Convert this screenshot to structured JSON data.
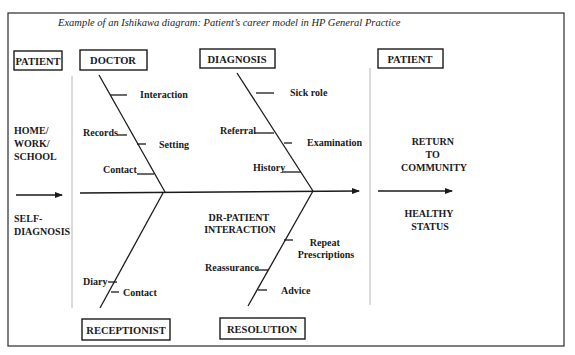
{
  "title": "Example of an Ishikawa diagram: Patient’s career  model in HP General Practice",
  "left_column": {
    "header": "PATIENT",
    "top_text": [
      "HOME/",
      "WORK/",
      "SCHOOL"
    ],
    "bottom_text": [
      "SELF-",
      "DIAGNOSIS"
    ]
  },
  "right_column": {
    "header": "PATIENT",
    "top_text": [
      "RETURN",
      "TO",
      "COMMUNITY"
    ],
    "bottom_text": [
      "HEALTHY",
      "STATUS"
    ]
  },
  "categories": {
    "doctor": {
      "label": "DOCTOR",
      "causes": [
        "Interaction",
        "Records",
        "Setting",
        "Contact"
      ]
    },
    "diagnosis": {
      "label": "DIAGNOSIS",
      "causes": [
        "Sick role",
        "Referral",
        "Examination",
        "History"
      ]
    },
    "receptionist": {
      "label": "RECEPTIONIST",
      "causes": [
        "Diary",
        "Contact"
      ]
    },
    "resolution": {
      "label": "RESOLUTION",
      "causes": [
        "Repeat",
        "Prescriptions",
        "Reassurance",
        "Advice"
      ]
    }
  },
  "center_label": [
    "DR-PATIENT",
    "INTERACTION"
  ],
  "colors": {
    "line": "#1a1a1a",
    "divider": "#b8b8b8",
    "background": "#ffffff"
  }
}
